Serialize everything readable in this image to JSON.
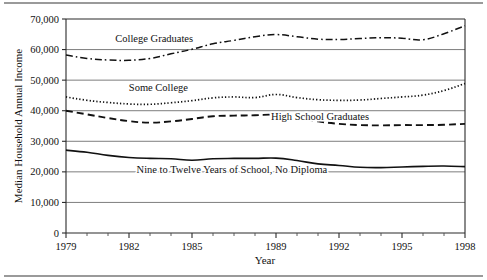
{
  "chart_data": {
    "type": "line",
    "title": "",
    "xlabel": "Year",
    "ylabel": "Median Household Annual Income",
    "xlim": [
      1979,
      1998
    ],
    "ylim": [
      0,
      70000
    ],
    "grid": true,
    "legend_position": "inline-labels",
    "x": [
      1979,
      1980,
      1981,
      1982,
      1983,
      1984,
      1985,
      1986,
      1987,
      1988,
      1989,
      1990,
      1991,
      1992,
      1993,
      1994,
      1995,
      1996,
      1997,
      1998
    ],
    "y_ticks": [
      0,
      10000,
      20000,
      30000,
      40000,
      50000,
      60000,
      70000
    ],
    "y_tick_labels": [
      "0",
      "10,000",
      "20,000",
      "30,000",
      "40,000",
      "50,000",
      "60,000",
      "70,000"
    ],
    "x_tick_labels_major": [
      "1979",
      "1982",
      "1985",
      "1989",
      "1992",
      "1995",
      "1998"
    ],
    "x_ticks_major": [
      1979,
      1982,
      1985,
      1989,
      1992,
      1995,
      1998
    ],
    "series": [
      {
        "name": "College Graduates",
        "style": "dash-dot",
        "label_x": 1983.2,
        "label_y": 62600,
        "values": [
          58200,
          57100,
          56600,
          56500,
          57100,
          58600,
          60100,
          61900,
          63000,
          64200,
          64900,
          64200,
          63400,
          63300,
          63600,
          63900,
          63700,
          63200,
          65200,
          67800
        ]
      },
      {
        "name": "Some College",
        "style": "dotted",
        "label_x": 1983.4,
        "label_y": 46300,
        "values": [
          44500,
          43400,
          42700,
          42200,
          42100,
          42600,
          43300,
          44200,
          44500,
          44300,
          45300,
          44300,
          43600,
          43400,
          43500,
          44000,
          44500,
          45100,
          46600,
          48900
        ]
      },
      {
        "name": "High School Graduates",
        "style": "dashed",
        "label_x": 1991.1,
        "label_y": 36900,
        "values": [
          40000,
          38800,
          37600,
          36600,
          36100,
          36500,
          37300,
          38200,
          38400,
          38500,
          38700,
          37800,
          36500,
          35700,
          35300,
          35200,
          35300,
          35300,
          35400,
          35700
        ]
      },
      {
        "name": "Nine to Twelve Years of School, No Diploma",
        "style": "solid",
        "label_x": 1986.9,
        "label_y": 19600,
        "values": [
          27100,
          26400,
          25400,
          24700,
          24400,
          24300,
          23800,
          24300,
          24400,
          24400,
          24500,
          23700,
          22600,
          22100,
          21500,
          21400,
          21600,
          21800,
          21900,
          21700
        ]
      }
    ]
  }
}
